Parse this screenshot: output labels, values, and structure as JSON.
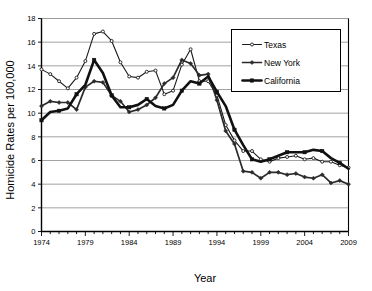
{
  "chart_data": {
    "type": "line",
    "title": "",
    "xlabel": "Year",
    "ylabel": "Homicide Rates per 100,000",
    "xlim": [
      1974,
      2009
    ],
    "ylim": [
      0,
      18
    ],
    "ytick_step": 2,
    "xtick_step": 5,
    "grid": "horizontal",
    "legend_position": "upper-right",
    "x": [
      1974,
      1975,
      1976,
      1977,
      1978,
      1979,
      1980,
      1981,
      1982,
      1983,
      1984,
      1985,
      1986,
      1987,
      1988,
      1989,
      1990,
      1991,
      1992,
      1993,
      1994,
      1995,
      1996,
      1997,
      1998,
      1999,
      2000,
      2001,
      2002,
      2003,
      2004,
      2005,
      2006,
      2007,
      2008,
      2009
    ],
    "xticklabels": [
      "1974",
      "1979",
      "1984",
      "1989",
      "1994",
      "1999",
      "2004",
      "2009"
    ],
    "yticklabels": [
      "0",
      "2",
      "4",
      "6",
      "8",
      "10",
      "12",
      "14",
      "16",
      "18"
    ],
    "series": [
      {
        "name": "Texas",
        "marker": "open-circle",
        "linewidth": "thin",
        "color": "#1a1a1a",
        "values": [
          13.7,
          13.3,
          12.7,
          12.1,
          13.0,
          14.4,
          16.7,
          16.9,
          16.1,
          14.3,
          13.1,
          13.0,
          13.5,
          13.6,
          11.6,
          11.9,
          14.1,
          15.4,
          12.7,
          12.7,
          11.5,
          9.0,
          7.7,
          6.8,
          6.8,
          6.1,
          5.9,
          6.2,
          6.3,
          6.4,
          6.1,
          6.2,
          5.9,
          5.9,
          5.6,
          5.4
        ]
      },
      {
        "name": "New York",
        "marker": "filled-diamond",
        "linewidth": "medium",
        "color": "#2b2b2b",
        "values": [
          10.6,
          11.0,
          10.9,
          10.9,
          10.3,
          12.2,
          12.7,
          12.6,
          11.5,
          11.0,
          10.1,
          10.3,
          10.7,
          11.3,
          12.5,
          13.0,
          14.5,
          14.2,
          13.2,
          13.3,
          11.1,
          8.5,
          7.4,
          5.1,
          5.0,
          4.5,
          5.0,
          5.0,
          4.8,
          4.9,
          4.6,
          4.5,
          4.8,
          4.1,
          4.3,
          4.0
        ]
      },
      {
        "name": "California",
        "marker": "filled-square",
        "linewidth": "thick",
        "color": "#111111",
        "values": [
          9.4,
          10.1,
          10.2,
          10.4,
          11.6,
          12.4,
          14.5,
          13.4,
          11.5,
          10.5,
          10.5,
          10.7,
          11.2,
          10.6,
          10.4,
          10.7,
          11.9,
          12.7,
          12.5,
          13.1,
          11.8,
          10.6,
          8.6,
          7.3,
          6.1,
          5.9,
          6.1,
          6.4,
          6.7,
          6.7,
          6.7,
          6.9,
          6.8,
          6.2,
          5.8,
          5.3
        ]
      }
    ]
  },
  "legend": {
    "items": [
      {
        "label": "Texas"
      },
      {
        "label": "New York"
      },
      {
        "label": "California"
      }
    ]
  },
  "axes": {
    "y_title": "Homicide Rates per 100,000",
    "x_title": "Year"
  }
}
